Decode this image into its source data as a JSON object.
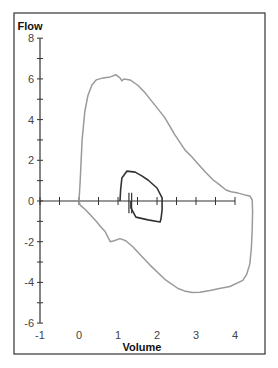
{
  "chart_data": {
    "type": "line",
    "title": "",
    "xlabel": "Volume",
    "ylabel": "Flow",
    "xlim": [
      -1,
      4.6
    ],
    "ylim": [
      -6,
      8
    ],
    "x_ticks": [
      -1,
      0,
      1,
      2,
      3,
      4
    ],
    "y_ticks": [
      -6,
      -4,
      -2,
      0,
      2,
      4,
      6,
      8
    ],
    "x_minor_step": 0.5,
    "y_minor_step": 1,
    "grid": false,
    "legend": "none",
    "series": [
      {
        "name": "Outer flow-volume loop",
        "color": "#9a9a9a",
        "points": [
          [
            0,
            0
          ],
          [
            0.03,
            1.0
          ],
          [
            0.08,
            3.0
          ],
          [
            0.15,
            4.4
          ],
          [
            0.23,
            5.2
          ],
          [
            0.33,
            5.7
          ],
          [
            0.44,
            5.95
          ],
          [
            0.62,
            6.05
          ],
          [
            0.8,
            6.1
          ],
          [
            0.95,
            6.2
          ],
          [
            1.05,
            6.05
          ],
          [
            1.1,
            5.9
          ],
          [
            1.15,
            6.0
          ],
          [
            1.31,
            5.95
          ],
          [
            1.5,
            5.7
          ],
          [
            1.7,
            5.3
          ],
          [
            1.95,
            4.7
          ],
          [
            2.2,
            4.1
          ],
          [
            2.46,
            3.25
          ],
          [
            2.72,
            2.5
          ],
          [
            2.88,
            2.2
          ],
          [
            3.03,
            1.87
          ],
          [
            3.25,
            1.4
          ],
          [
            3.44,
            1.03
          ],
          [
            3.6,
            0.8
          ],
          [
            3.77,
            0.54
          ],
          [
            3.9,
            0.45
          ],
          [
            4.08,
            0.39
          ],
          [
            4.25,
            0.3
          ],
          [
            4.38,
            0.25
          ],
          [
            4.44,
            0.05
          ],
          [
            4.45,
            -0.5
          ],
          [
            4.44,
            -1.4
          ],
          [
            4.42,
            -2.3
          ],
          [
            4.38,
            -3.1
          ],
          [
            4.3,
            -3.6
          ],
          [
            4.2,
            -3.9
          ],
          [
            3.87,
            -4.2
          ],
          [
            3.6,
            -4.3
          ],
          [
            3.36,
            -4.4
          ],
          [
            3.1,
            -4.48
          ],
          [
            2.9,
            -4.5
          ],
          [
            2.7,
            -4.42
          ],
          [
            2.54,
            -4.3
          ],
          [
            2.2,
            -3.85
          ],
          [
            1.82,
            -3.15
          ],
          [
            1.6,
            -2.7
          ],
          [
            1.38,
            -2.25
          ],
          [
            1.2,
            -1.95
          ],
          [
            1.05,
            -1.85
          ],
          [
            0.9,
            -1.95
          ],
          [
            0.8,
            -2.0
          ],
          [
            0.67,
            -1.5
          ],
          [
            0.55,
            -1.25
          ],
          [
            0.44,
            -1.0
          ],
          [
            0.3,
            -0.7
          ],
          [
            0.18,
            -0.45
          ],
          [
            0.03,
            -0.2
          ],
          [
            0,
            0
          ]
        ]
      },
      {
        "name": "Inner tidal loop",
        "color": "#333333",
        "points": [
          [
            1.05,
            0
          ],
          [
            1.07,
            0.6
          ],
          [
            1.1,
            1.13
          ],
          [
            1.23,
            1.47
          ],
          [
            1.44,
            1.42
          ],
          [
            1.6,
            1.25
          ],
          [
            1.77,
            1.03
          ],
          [
            2.0,
            0.64
          ],
          [
            2.13,
            0.15
          ],
          [
            2.13,
            -0.44
          ],
          [
            2.1,
            -0.9
          ],
          [
            2.08,
            -1.03
          ],
          [
            1.77,
            -0.93
          ],
          [
            1.46,
            -0.79
          ],
          [
            1.33,
            -0.34
          ],
          [
            1.33,
            0
          ]
        ]
      }
    ],
    "annotations": []
  }
}
